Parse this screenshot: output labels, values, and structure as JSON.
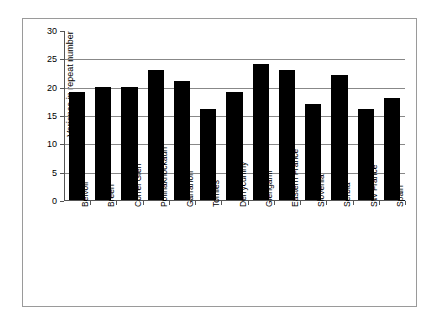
{
  "chart_data": {
    "type": "bar",
    "title": "",
    "xlabel": "",
    "ylabel": "Variance in repeat number",
    "ylim": [
      0,
      30
    ],
    "ytick_step": 5,
    "yticks": [
      "0",
      "5",
      "10",
      "15",
      "20",
      "25",
      "30"
    ],
    "grid": true,
    "grid_axis": "y",
    "legend": "none",
    "bar_color": "#000000",
    "plot_background": "#FFFFFF",
    "gridline_color": "#888888",
    "border_color": "#9A9A9A",
    "categories": [
      "Belvoir",
      "Breen",
      "Correl Glen",
      "Pollnaknockaun",
      "Garranon",
      "Tomies",
      "Derrycunihy",
      "Glengariff",
      "Eastern France",
      "Slovenia",
      "Serbia",
      "SW France",
      "Spain"
    ],
    "values": [
      19,
      20,
      20,
      23,
      21,
      16,
      19,
      24,
      23,
      17,
      22,
      16,
      18
    ]
  }
}
